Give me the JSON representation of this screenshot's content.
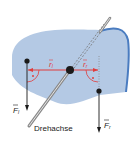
{
  "diagram": {
    "axis_label": "Drehachse",
    "force_left": "F",
    "force_left_sub": "l",
    "force_right": "F",
    "force_right_sub": "r",
    "lever_left": "r",
    "lever_left_sub": "l",
    "lever_right": "r",
    "lever_right_sub": "r",
    "colors": {
      "body_fill": "#b4c9e4",
      "body_edge": "#4a7cc0",
      "lever_red": "#e03c3c",
      "axis_gray": "#9a9a9a",
      "black": "#1a1a1a"
    }
  }
}
